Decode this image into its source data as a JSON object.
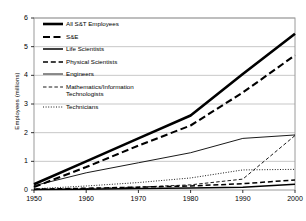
{
  "chart_data": {
    "type": "line",
    "title": "",
    "xlabel": "",
    "ylabel": "Employees (millions)",
    "xlim": [
      1950,
      2000
    ],
    "ylim": [
      0,
      6
    ],
    "xticks": [
      "1950",
      "1960",
      "1970",
      "1980",
      "1990",
      "2000"
    ],
    "yticks": [
      "0",
      "1",
      "2",
      "3",
      "4",
      "5",
      "6"
    ],
    "grid": "horizontal",
    "legend_position": "upper-left-inside",
    "x": [
      1950,
      1960,
      1970,
      1980,
      1990,
      2000
    ],
    "series": [
      {
        "name": "All S&T Employees",
        "style": "solid-extra-thick",
        "color": "#000000",
        "values": [
          0.2,
          1.0,
          1.8,
          2.6,
          4.05,
          5.45
        ]
      },
      {
        "name": "S&E",
        "style": "dashed-thick",
        "color": "#000000",
        "values": [
          0.1,
          0.8,
          1.55,
          2.25,
          3.4,
          4.7
        ]
      },
      {
        "name": "Life Scientists",
        "style": "solid-medium",
        "color": "#000000",
        "values": [
          0.02,
          0.03,
          0.05,
          0.07,
          0.1,
          0.2
        ]
      },
      {
        "name": "Physical Scientists",
        "style": "dashed-medium",
        "color": "#000000",
        "values": [
          0.03,
          0.06,
          0.1,
          0.14,
          0.22,
          0.35
        ]
      },
      {
        "name": "Engineers",
        "style": "solid-thin",
        "color": "#000000",
        "values": [
          0.15,
          0.6,
          0.95,
          1.3,
          1.8,
          1.92
        ]
      },
      {
        "name": "Mathematics/Information Technologists",
        "style": "dashed-thin",
        "color": "#000000",
        "values": [
          0.01,
          0.05,
          0.1,
          0.18,
          0.38,
          1.9
        ]
      },
      {
        "name": "Technicians",
        "style": "dotted-thin",
        "color": "#000000",
        "values": [
          0.04,
          0.14,
          0.26,
          0.42,
          0.7,
          0.72
        ]
      }
    ]
  },
  "legend": {
    "items": [
      {
        "label": "All S&T Employees",
        "style": "solid-extra-thick"
      },
      {
        "label": "S&E",
        "style": "dashed-thick"
      },
      {
        "label": "Life Scientists",
        "style": "solid-medium"
      },
      {
        "label": "Physical Scientists",
        "style": "dashed-medium"
      },
      {
        "label": "Engineers",
        "style": "solid-thin"
      },
      {
        "label": "Mathematics/Information\nTechnologists",
        "style": "dashed-thin"
      },
      {
        "label": "Technicians",
        "style": "dotted-thin"
      }
    ]
  },
  "axes": {
    "y_title": "Employees (millions)",
    "y_labels": [
      "6",
      "5",
      "4",
      "3",
      "2",
      "1",
      "0"
    ],
    "x_labels": [
      "1950",
      "1960",
      "1970",
      "1980",
      "1990",
      "2000"
    ]
  },
  "colors": {
    "line": "#000000",
    "grid": "#b9b9b9",
    "frame": "#9a9a9a",
    "background": "#ffffff"
  }
}
